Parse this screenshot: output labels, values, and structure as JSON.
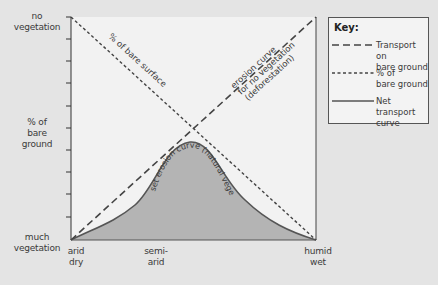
{
  "y_axis": {
    "top_label_line1": "no",
    "top_label_line2": "vegetation",
    "mid_label_line1": "% of",
    "mid_label_line2": "bare",
    "mid_label_line3": "ground",
    "bottom_label_line1": "much",
    "bottom_label_line2": "vegetation"
  },
  "x_axis": {
    "left_line1": "arid",
    "left_line2": "dry",
    "mid_line1": "semi-",
    "mid_line2": "arid",
    "right_line1": "humid",
    "right_line2": "wet"
  },
  "curve_labels": {
    "bare_surface": "% of bare surface",
    "erosion_line1": "erosion curve",
    "erosion_line2": "for no vegetation",
    "erosion_line3": "(deforestation)",
    "net_curve": "set erosion curve (natural vegetation)"
  },
  "key": {
    "title": "Key:",
    "items": [
      {
        "style": "long-dash",
        "line1": "Transport on",
        "line2": "bare ground"
      },
      {
        "style": "short-dash",
        "line1": "% of",
        "line2": "bare ground"
      },
      {
        "style": "solid",
        "line1": "Net transport",
        "line2": "curve"
      }
    ]
  },
  "colors": {
    "background": "#e4e4e4",
    "plot_area": "#f2f2f2",
    "fill": "#b4b4b4",
    "line": "#444444"
  }
}
